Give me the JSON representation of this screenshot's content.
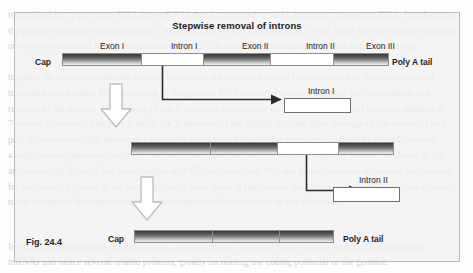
{
  "figure": {
    "title": "Stepwise removal of introns",
    "caption": "Fig. 24.4",
    "colors": {
      "exon_dark": "#3a3a3a",
      "exon_light": "#f4f4f4",
      "panel_bg": "#f1f1f1",
      "outline": "#8d8d8d"
    }
  },
  "rows": {
    "primary_transcript": {
      "cap_label": "Cap",
      "polya_label": "Poly A tail",
      "segment_labels": [
        "Exon I",
        "Intron I",
        "Exon II",
        "Intron II",
        "Exon III"
      ],
      "segments": [
        {
          "name": "Exon I",
          "kind": "exon"
        },
        {
          "name": "Intron I",
          "kind": "intron"
        },
        {
          "name": "Exon II",
          "kind": "exon"
        },
        {
          "name": "Intron II",
          "kind": "intron"
        },
        {
          "name": "Exon III",
          "kind": "exon"
        }
      ]
    },
    "intermediate_transcript": {
      "segments": [
        {
          "name": "Exon I",
          "kind": "exon"
        },
        {
          "name": "Exon II",
          "kind": "exon"
        },
        {
          "name": "Intron II",
          "kind": "intron"
        },
        {
          "name": "Exon III",
          "kind": "exon"
        }
      ]
    },
    "mature_mrna": {
      "cap_label": "Cap",
      "polya_label": "Poly A tail",
      "segments": [
        {
          "name": "Exon I",
          "kind": "exon"
        },
        {
          "name": "Exon II",
          "kind": "exon"
        },
        {
          "name": "Exon III",
          "kind": "exon"
        }
      ]
    }
  },
  "released": {
    "intron_one_label": "Intron I",
    "intron_two_label": "Intron II"
  },
  "background_text": {
    "top": "transcribed into a precursor RNA (pre-mRNA) that is processed to yield the mature messenger RNA. In eukaryotes,\nthe primary transcript is capped at its 5' end and a poly A tail is added at the 3' end, while the intervening sequences\nor introns are excised by a process called splicing. The remaining coding segments, the exons, are joined\n\ntogether. In eukaryotic cells the primary transcripts are processed before being exported to the cytoplasm and\ntranslated into protein. The processing of the primary RNA transcript includes capping, polyadenylation and\nremoval of the introns. The capping of the 5' terminus occurs early during transcription and involves addition of\n7-methyl guanosine. The poly A tail at the 3' terminus of the mRNA is added after cleavage of the transcript by a\npoly A polymerase. The introns of a transcript are removed by splicing reactions catalysed by the spliceosome,\na large ribonucleoprotein complex. The introns are removed one at a time in a stepwise fashion, as shown in the\naccompanying figure. Each intron begins with GU and ends with AG, and these consensus sequences are essential\nfor the correct excision of the intron. Splicing takes place in the nucleus and the processed mRNA is then exported\nto the cytoplasm through the nuclear pore complexes for translation on the ribosomes.",
    "bottom": "In some genes alternative splicing allows a single primary transcript to give rise to several different mature\nmRNAs and hence several related proteins, greatly increasing the coding potential of the genome."
  }
}
